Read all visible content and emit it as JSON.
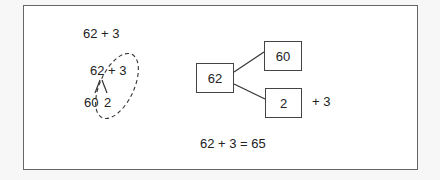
{
  "left_method": {
    "problem": "62 + 3",
    "decomposition_expr": "62 + 3",
    "split_parts": {
      "tens": "60",
      "ones": "2"
    }
  },
  "number_bond": {
    "whole": "62",
    "part_tens": "60",
    "part_ones": "2",
    "add_label": "+ 3"
  },
  "result": {
    "equation": "62 + 3 = 65"
  },
  "colors": {
    "frame_border": "#666666",
    "text": "#222222",
    "background": "#ffffff"
  }
}
